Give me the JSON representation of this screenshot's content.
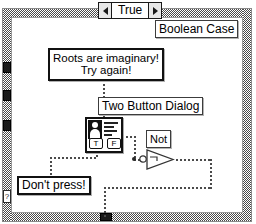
{
  "diagram": {
    "title": "Boolean Case",
    "structure_type": "case-structure",
    "selector": {
      "value": "True",
      "left_arrow": "◀",
      "right_arrow": "▶"
    },
    "selector_terminal_glyph": "?",
    "nodes": {
      "string_constant": {
        "line1": "Roots are imaginary!",
        "line2": "Try again!"
      },
      "two_button_dialog": {
        "label": "Two Button Dialog",
        "button_true": "T",
        "button_false": "F"
      },
      "not_function": {
        "label": "Not"
      },
      "boolean_constant": {
        "label": "Don't press!"
      }
    },
    "colors": {
      "wire": "#4a4a4a",
      "border": "#4a4a4a",
      "background": "#ffffff",
      "ink": "#000000"
    }
  }
}
